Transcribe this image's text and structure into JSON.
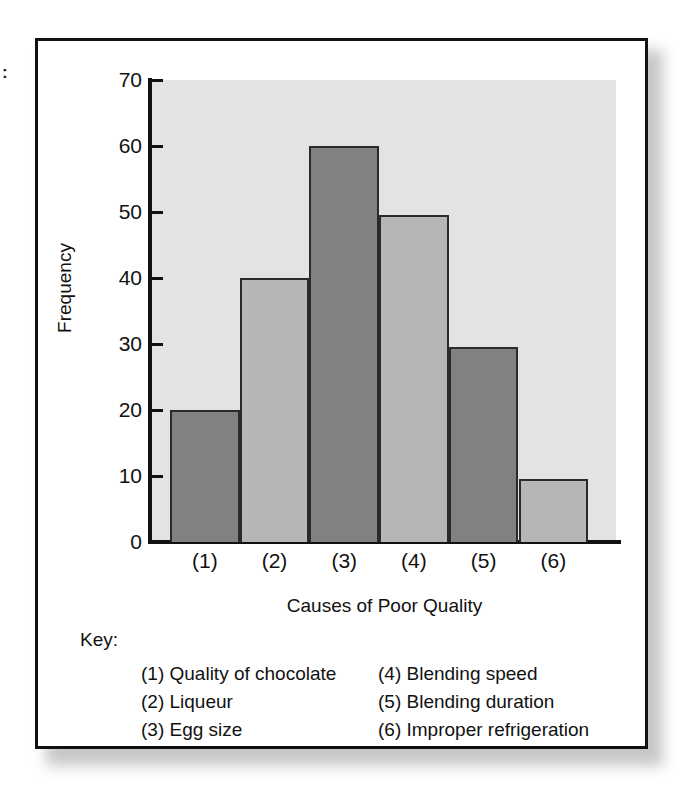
{
  "artifact": {
    "mark": ":"
  },
  "chart_data": {
    "type": "bar",
    "title": "",
    "xlabel": "Causes of Poor Quality",
    "ylabel": "Frequency",
    "categories": [
      "(1)",
      "(2)",
      "(3)",
      "(4)",
      "(5)",
      "(6)"
    ],
    "values": [
      20,
      40,
      60,
      49.5,
      29.5,
      9.5
    ],
    "bar_colors": [
      "#818181",
      "#b6b6b6",
      "#818181",
      "#b6b6b6",
      "#818181",
      "#b6b6b6"
    ],
    "ylim": [
      0,
      70
    ],
    "ytick_labels": [
      "70",
      "60",
      "50",
      "40",
      "30",
      "20",
      "10",
      "0"
    ],
    "ytick_values": [
      70,
      60,
      50,
      40,
      30,
      20,
      10,
      0
    ],
    "grid": false,
    "legend_position": "below-plot",
    "plot_background": "#e3e3e3",
    "frame_color": "#111111"
  },
  "key": {
    "label": "Key:",
    "rows": [
      {
        "left": "(1) Quality of chocolate",
        "right": "(4) Blending speed"
      },
      {
        "left": "(2) Liqueur",
        "right": "(5) Blending duration"
      },
      {
        "left": "(3) Egg size",
        "right": "(6) Improper refrigeration"
      }
    ]
  }
}
